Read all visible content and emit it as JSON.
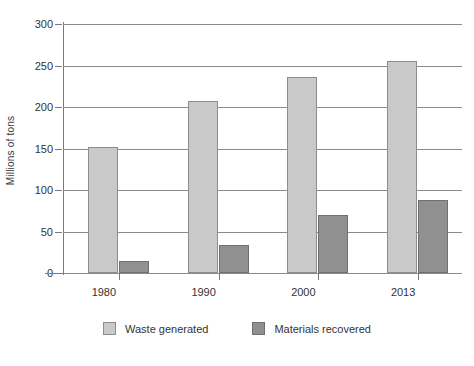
{
  "chart_data": {
    "type": "bar",
    "title": "",
    "xlabel": "",
    "ylabel": "Millions of tons",
    "categories": [
      "1980",
      "1990",
      "2000",
      "2013"
    ],
    "ylim": [
      0,
      300
    ],
    "yticks": [
      0,
      50,
      100,
      150,
      200,
      250,
      300
    ],
    "ytick_labels": [
      "0",
      "50",
      "100",
      "150",
      "200",
      "250",
      "300"
    ],
    "grid": true,
    "legend_position": "bottom",
    "series": [
      {
        "name": "Waste generated",
        "color": "#c9c9c9",
        "values": [
          152,
          207,
          236,
          256
        ]
      },
      {
        "name": "Materials recovered",
        "color": "#909090",
        "values": [
          15,
          34,
          70,
          88
        ]
      }
    ]
  }
}
